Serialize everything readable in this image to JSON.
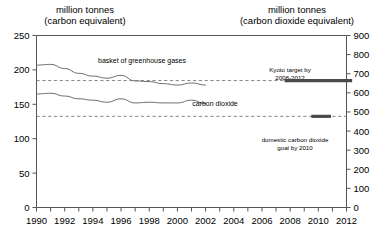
{
  "chart_data": {
    "type": "line",
    "title": "",
    "left_axis": {
      "header_line1": "million tonnes",
      "header_line2": "(carbon equivalent)",
      "ticks": [
        0,
        50,
        100,
        150,
        200,
        250
      ],
      "ylim": [
        0,
        250
      ]
    },
    "right_axis": {
      "header_line1": "million tonnes",
      "header_line2": "(carbon dioxide equivalent)",
      "ticks": [
        0,
        100,
        200,
        300,
        400,
        500,
        600,
        700,
        800,
        900
      ],
      "ylim": [
        0,
        900
      ]
    },
    "xlabel": "",
    "xlim": [
      1990,
      2012
    ],
    "x_tick_labels": [
      "1990",
      "1992",
      "1994",
      "1996",
      "1998",
      "2000",
      "2002",
      "2004",
      "2006",
      "2008",
      "2010",
      "2012"
    ],
    "x_minor_ticks": [
      1990,
      1991,
      1992,
      1993,
      1994,
      1995,
      1996,
      1997,
      1998,
      1999,
      2000,
      2001,
      2002,
      2003,
      2004,
      2005,
      2006,
      2007,
      2008,
      2009,
      2010,
      2011,
      2012
    ],
    "grid": false,
    "legend_position": "inline-annotations",
    "series": [
      {
        "name": "basket of greenhouse gases",
        "label": "basket of greenhouse gases",
        "x": [
          1990,
          1991,
          1992,
          1993,
          1994,
          1995,
          1996,
          1997,
          1998,
          1999,
          2000,
          2001,
          2002
        ],
        "values": [
          207,
          208,
          202,
          195,
          191,
          188,
          192,
          184,
          183,
          180,
          178,
          181,
          178
        ]
      },
      {
        "name": "carbon dioxide",
        "label": "carbon dioxide",
        "x": [
          1990,
          1991,
          1992,
          1993,
          1994,
          1995,
          1996,
          1997,
          1998,
          1999,
          2000,
          2001,
          2002
        ],
        "values": [
          165,
          166,
          162,
          158,
          156,
          153,
          158,
          152,
          153,
          152,
          152,
          156,
          151
        ]
      }
    ],
    "reference_lines": [
      {
        "name": "kyoto-target-level",
        "value": 184.5,
        "style": "dashed"
      },
      {
        "name": "domestic-co2-goal-level",
        "value": 132.5,
        "style": "dashed"
      }
    ],
    "annotations": [
      {
        "name": "kyoto-target",
        "text_line1": "Kyoto target by",
        "text_line2": "2008-2012",
        "bar_value": 184.5,
        "bar_x_start": 2007.6,
        "bar_x_end": 2012.4
      },
      {
        "name": "domestic-co2-goal",
        "text_line1": "domestic carbon dioxide",
        "text_line2": "goal by 2010",
        "bar_value": 132.5,
        "bar_x_start": 2009.5,
        "bar_x_end": 2010.9
      }
    ],
    "colors": {
      "line": "#6b6b6b",
      "axis": "#555555",
      "dashed": "#777777",
      "target_bar": "#4a4a4a",
      "background": "#ffffff"
    }
  }
}
